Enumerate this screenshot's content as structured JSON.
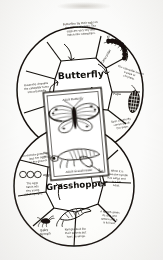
{
  "document": {
    "title": "Insect Life Cycle Wheel",
    "medium": "hand-drawn pencil and ink worksheet",
    "top_smudge": "faint pencil smudge"
  },
  "colors": {
    "ink": "#14110c",
    "paper": "#fdfdfb",
    "background": "#fbfbfa",
    "pencil_gray": "#6f6a60"
  },
  "upper_wheel": {
    "name": "butterfly-wheel",
    "title": "Butterfly",
    "cycle_type": "complete metamorphosis",
    "segments": [
      {
        "id": "b-top",
        "position": "top",
        "label": "",
        "note": "Butterflies lay their eggs on the leaves of plants. The eggs are very tiny and hatch into caterpillars.",
        "drawing": ""
      },
      {
        "id": "b-upper-right",
        "position": "upper-right",
        "label": "Caterpillar",
        "note": "",
        "drawing": "caterpillar"
      },
      {
        "id": "b-right-upper",
        "position": "right-upper",
        "label": "",
        "note": "The caterpillar makes a pupa or chrysalis.",
        "drawing": ""
      },
      {
        "id": "b-right",
        "position": "right",
        "label": "Pupa",
        "note": "",
        "drawing": "pupa"
      },
      {
        "id": "b-lower-right",
        "position": "lower-right",
        "label": "",
        "note": "Soon a butterfly comes out of the pupa.",
        "drawing": ""
      },
      {
        "id": "b-left",
        "position": "left",
        "label": "",
        "note": "Inside the chrysalis the caterpillar turns into a butterfly.",
        "drawing": ""
      }
    ]
  },
  "lower_wheel": {
    "name": "grasshopper-wheel",
    "title": "Grasshopper",
    "cycle_type": "incomplete metamorphosis",
    "egg_marks": "OOO",
    "egg_label": "eggs",
    "segments": [
      {
        "id": "g-upper-left",
        "position": "upper-left",
        "label": "",
        "note": "The female grasshopper lays her eggs in the ground.",
        "drawing": ""
      },
      {
        "id": "g-left",
        "position": "left",
        "label": "",
        "note": "The eggs hatch into tiny young called nymphs.",
        "drawing": ""
      },
      {
        "id": "g-lower-left",
        "position": "lower-left",
        "label": "Baby Nymph",
        "note": "",
        "drawing": "nymph"
      },
      {
        "id": "g-bottom",
        "position": "bottom",
        "label": "",
        "note": "Nymphs look like their parents but have no wings.",
        "drawing": ""
      },
      {
        "id": "g-lower-right",
        "position": "lower-right",
        "label": "",
        "note": "A nymph sheds its skin and grows until it is full size.",
        "drawing": "molting-nymph"
      },
      {
        "id": "g-right",
        "position": "right",
        "label": "",
        "note": "When it is grown the nymph has wings and is a full adult.",
        "drawing": ""
      }
    ]
  },
  "center_card": {
    "name": "specimen-card",
    "top_caption": "Adult Butterfly",
    "top_drawing": "butterfly",
    "bottom_caption": "Adult Grasshopper",
    "bottom_drawing": "grasshopper"
  }
}
